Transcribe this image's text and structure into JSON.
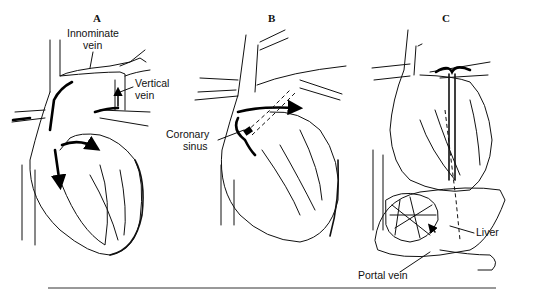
{
  "figure": {
    "panels": [
      {
        "id": "A",
        "label": "A",
        "annotations": [
          "Innominate vein",
          "Vertical vein"
        ]
      },
      {
        "id": "B",
        "label": "B",
        "annotations": [
          "Coronary sinus"
        ]
      },
      {
        "id": "C",
        "label": "C",
        "annotations": [
          "Liver",
          "Portal vein"
        ]
      }
    ],
    "labels": {
      "panel_a": "A",
      "panel_b": "B",
      "panel_c": "C",
      "innominate_1": "Innominate",
      "innominate_2": "vein",
      "vertical_1": "Vertical",
      "vertical_2": "vein",
      "coronary_1": "Coronary",
      "coronary_2": "sinus",
      "liver": "Liver",
      "portal": "Portal vein"
    }
  }
}
